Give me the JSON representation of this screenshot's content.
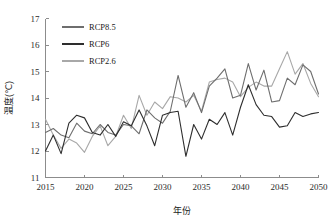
{
  "chart_data": {
    "type": "line",
    "title": "",
    "xlabel": "年份",
    "ylabel": "温度(℃)",
    "xlim": [
      2015,
      2050
    ],
    "ylim": [
      11,
      17
    ],
    "xticks": [
      2015,
      2020,
      2025,
      2030,
      2035,
      2040,
      2045,
      2050
    ],
    "yticks": [
      11,
      12,
      13,
      14,
      15,
      16,
      17
    ],
    "grid": false,
    "legend_position": "top-left",
    "x": [
      2015,
      2016,
      2017,
      2018,
      2019,
      2020,
      2021,
      2022,
      2023,
      2024,
      2025,
      2026,
      2027,
      2028,
      2029,
      2030,
      2031,
      2032,
      2033,
      2034,
      2035,
      2036,
      2037,
      2038,
      2039,
      2040,
      2041,
      2042,
      2043,
      2044,
      2045,
      2046,
      2047,
      2048,
      2049,
      2050
    ],
    "series": [
      {
        "name": "RCP8.5",
        "color": "#6e6e6e",
        "values": [
          12.7,
          12.85,
          12.6,
          12.5,
          13.05,
          12.75,
          12.65,
          13.0,
          12.7,
          12.6,
          13.0,
          12.95,
          12.65,
          13.55,
          13.25,
          13.05,
          13.5,
          14.85,
          13.65,
          14.2,
          13.45,
          14.45,
          14.75,
          15.1,
          14.0,
          14.1,
          15.3,
          14.3,
          15.05,
          13.85,
          13.9,
          14.75,
          14.5,
          15.25,
          15.0,
          14.15
        ]
      },
      {
        "name": "RCP6",
        "color": "#2e2e2e",
        "values": [
          12.0,
          12.6,
          11.9,
          13.05,
          13.35,
          13.25,
          12.7,
          12.6,
          13.0,
          12.55,
          13.1,
          12.95,
          13.55,
          12.95,
          12.2,
          13.35,
          13.45,
          13.5,
          11.8,
          13.0,
          12.45,
          13.2,
          13.0,
          13.45,
          12.6,
          13.65,
          14.5,
          13.75,
          13.35,
          13.3,
          12.9,
          12.95,
          13.45,
          13.3,
          13.4,
          13.45
        ]
      },
      {
        "name": "RCP2.6",
        "color": "#a8a8a8",
        "values": [
          13.2,
          12.6,
          12.1,
          12.45,
          12.3,
          11.95,
          12.55,
          12.95,
          12.2,
          12.55,
          13.35,
          12.85,
          14.1,
          13.35,
          13.85,
          13.6,
          14.05,
          14.0,
          13.85,
          14.1,
          13.5,
          14.6,
          14.7,
          14.75,
          14.6,
          14.05,
          14.4,
          14.6,
          14.45,
          14.45,
          15.1,
          15.75,
          14.9,
          15.3,
          14.55,
          14.05
        ]
      }
    ]
  },
  "legend": {
    "items": [
      {
        "label": "RCP8.5",
        "color": "#6e6e6e"
      },
      {
        "label": "RCP6",
        "color": "#2e2e2e"
      },
      {
        "label": "RCP2.6",
        "color": "#a8a8a8"
      }
    ]
  },
  "axes": {
    "x_tick_labels": [
      "2015",
      "2020",
      "2025",
      "2030",
      "2035",
      "2040",
      "2045",
      "2050"
    ],
    "y_tick_labels": [
      "11",
      "12",
      "13",
      "14",
      "15",
      "16",
      "17"
    ],
    "x_title": "年份",
    "y_title": "温度(℃)"
  }
}
